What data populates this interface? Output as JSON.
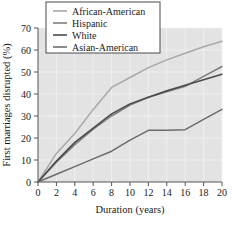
{
  "chart_data": {
    "type": "line",
    "title": "",
    "xlabel": "Duration (years)",
    "ylabel": "First marriages disrupted (%)",
    "xlim": [
      0,
      20
    ],
    "ylim": [
      0,
      70
    ],
    "xticks": [
      0,
      2,
      4,
      6,
      8,
      10,
      12,
      14,
      16,
      18,
      20
    ],
    "yticks": [
      0,
      10,
      20,
      30,
      40,
      50,
      60,
      70
    ],
    "grid": true,
    "legend_position": "top-center",
    "plot_background": "#e3e3e3",
    "x": [
      0,
      2,
      4,
      6,
      8,
      10,
      12,
      14,
      16,
      18,
      20
    ],
    "series": [
      {
        "name": "African-American",
        "color": "#a8a8a8",
        "values": [
          0,
          13,
          22,
          33,
          43,
          47.5,
          52,
          55.5,
          58.5,
          61.5,
          64
        ]
      },
      {
        "name": "Hispanic",
        "color": "#7d7d7d",
        "values": [
          0,
          9,
          17,
          24,
          30,
          35,
          38.5,
          41,
          43.5,
          48,
          52.5
        ]
      },
      {
        "name": "White",
        "color": "#4a4a4a",
        "values": [
          0,
          9.5,
          18,
          24.5,
          31,
          35.5,
          38.5,
          41.5,
          44,
          46.5,
          49
        ]
      },
      {
        "name": "Asian-American",
        "color": "#6b6b6b",
        "values": [
          0,
          3.5,
          7,
          10.5,
          14,
          19,
          23.5,
          23.5,
          23.8,
          28.5,
          33
        ]
      }
    ]
  },
  "legend": {
    "entries": [
      {
        "label": "African-American"
      },
      {
        "label": "Hispanic"
      },
      {
        "label": "White"
      },
      {
        "label": "Asian-American"
      }
    ]
  }
}
